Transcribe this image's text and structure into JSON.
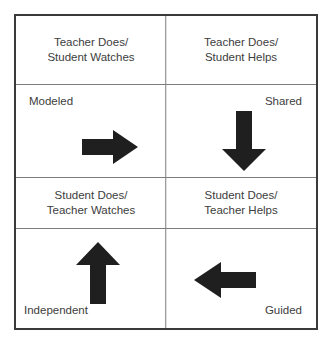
{
  "figure": {
    "name": "gradual-release-of-responsibility-quadrant",
    "clipped_top_text": "",
    "colors": {
      "outer_border": "#3a3a3a",
      "inner_divider": "#7d7d7d",
      "text": "#3d3d3d",
      "arrow_fill": "#1f1f1f",
      "background": "#ffffff"
    }
  },
  "quadrants": {
    "top_left": {
      "header": "Teacher Does/\nStudent Watches",
      "stage_label": "Modeled",
      "arrow": "arrow-right-icon"
    },
    "top_right": {
      "header": "Teacher Does/\nStudent Helps",
      "stage_label": "Shared",
      "arrow": "arrow-down-icon"
    },
    "bottom_left": {
      "header": "Student Does/\nTeacher Watches",
      "stage_label": "Independent",
      "arrow": "arrow-up-icon"
    },
    "bottom_right": {
      "header": "Student Does/\nTeacher Helps",
      "stage_label": "Guided",
      "arrow": "arrow-left-icon"
    }
  }
}
